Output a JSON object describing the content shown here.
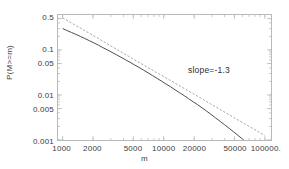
{
  "chart_data": {
    "type": "line",
    "title": "",
    "xlabel": "m",
    "ylabel": "P(M>=m)",
    "xscale": "log",
    "yscale": "log",
    "xlim": [
      900,
      115000
    ],
    "ylim": [
      0.001,
      0.6
    ],
    "grid": false,
    "legend": null,
    "xticks": [
      {
        "value": 1000,
        "label": "1000"
      },
      {
        "value": 2000,
        "label": "2000"
      },
      {
        "value": 5000,
        "label": "5000"
      },
      {
        "value": 10000,
        "label": "10000"
      },
      {
        "value": 20000,
        "label": "20000"
      },
      {
        "value": 50000,
        "label": "50000"
      },
      {
        "value": 100000,
        "label": "100000."
      }
    ],
    "yticks": [
      {
        "value": 0.5,
        "label": "0.5"
      },
      {
        "value": 0.1,
        "label": "0.1"
      },
      {
        "value": 0.05,
        "label": "0.05"
      },
      {
        "value": 0.01,
        "label": "0.01"
      },
      {
        "value": 0.005,
        "label": "0.005"
      },
      {
        "value": 0.001,
        "label": "0.001"
      }
    ],
    "annotations": [
      {
        "text": "slope=-1.3",
        "x": 33000,
        "y": 0.035
      }
    ],
    "series": [
      {
        "name": "empirical-ccdf",
        "style": "solid",
        "color": "#4a4a4a",
        "x": [
          1000,
          1100,
          1220,
          1350,
          1500,
          1660,
          1840,
          2040,
          2260,
          2500,
          2780,
          3080,
          3410,
          3780,
          4190,
          4640,
          5140,
          5700,
          6310,
          7000,
          7750,
          8590,
          9520,
          10500,
          11700,
          12900,
          14300,
          15900,
          17600,
          19500,
          21600,
          23900,
          26500,
          29400,
          32500,
          36100,
          40000,
          44300,
          49100,
          54400,
          60300,
          66800,
          74000,
          82000,
          90900,
          100000,
          105000
        ],
        "y": [
          0.3,
          0.272,
          0.246,
          0.223,
          0.2,
          0.18,
          0.161,
          0.144,
          0.128,
          0.113,
          0.1,
          0.0885,
          0.0782,
          0.069,
          0.0607,
          0.0533,
          0.0467,
          0.0409,
          0.0357,
          0.0311,
          0.027,
          0.0234,
          0.0203,
          0.0176,
          0.0152,
          0.0131,
          0.0113,
          0.0097,
          0.0083,
          0.0071,
          0.0061,
          0.0052,
          0.0044,
          0.0037,
          0.0031,
          0.0026,
          0.00218,
          0.00182,
          0.00152,
          0.00126,
          0.00104,
          0.00088,
          0.00078,
          0.0007,
          0.00077,
          0.00091,
          0.001
        ]
      },
      {
        "name": "power-law-fit",
        "style": "dashed",
        "color": "#9a9a9a",
        "slope": -1.3,
        "x": [
          1000,
          2000,
          5000,
          10000,
          20000,
          50000,
          100000
        ],
        "y": [
          0.52,
          0.211,
          0.0629,
          0.0256,
          0.0104,
          0.0031,
          0.00126
        ]
      }
    ]
  },
  "axis": {
    "ylabel_text": "P(M>=m)",
    "xlabel_text": "m"
  },
  "annotation": {
    "slope_text": "slope=-1.3"
  },
  "colors": {
    "frame": "#b9b9b9",
    "curve": "#4a4a4a",
    "fit": "#9a9a9a",
    "text": "#3b3b3b",
    "background": "#ffffff"
  }
}
